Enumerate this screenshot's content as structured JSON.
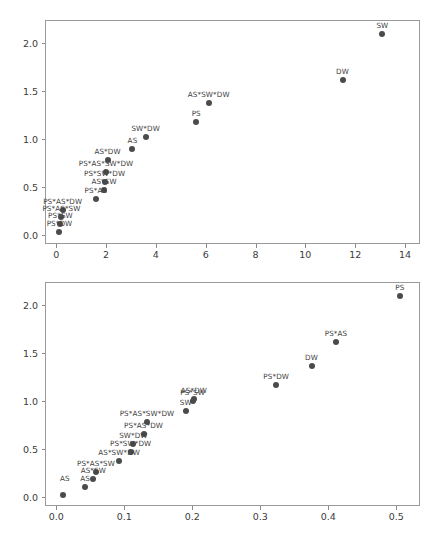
{
  "figure": {
    "background_color": "#ffffff",
    "marker_color": "#4b4b4b",
    "axis_color": "#9a9a9a",
    "text_color": "#3b3b3b",
    "panel_count": 2
  },
  "chart_data": [
    {
      "type": "scatter",
      "title": "",
      "xlabel": "",
      "ylabel": "",
      "xlim": [
        -0.45,
        14.6
      ],
      "ylim": [
        -0.09,
        2.24
      ],
      "grid": false,
      "legend": "none",
      "xticks": [
        0,
        2,
        4,
        6,
        8,
        10,
        12,
        14
      ],
      "xticklabels": [
        "0",
        "2",
        "4",
        "6",
        "8",
        "10",
        "12",
        "14"
      ],
      "yticks": [
        0.0,
        0.5,
        1.0,
        1.5,
        2.0
      ],
      "yticklabels": [
        "0.0",
        "0.5",
        "1.0",
        "1.5",
        "2.0"
      ],
      "points": [
        {
          "label": "SW",
          "x": 13.05,
          "y": 2.105
        },
        {
          "label": "DW",
          "x": 11.45,
          "y": 1.625
        },
        {
          "label": "AS*SW*DW",
          "x": 6.08,
          "y": 1.385
        },
        {
          "label": "PS",
          "x": 5.58,
          "y": 1.185
        },
        {
          "label": "SW*DW",
          "x": 3.55,
          "y": 1.035
        },
        {
          "label": "AS",
          "x": 3.02,
          "y": 0.905
        },
        {
          "label": "AS*DW",
          "x": 2.02,
          "y": 0.795
        },
        {
          "label": "PS*AS*SW*DW",
          "x": 1.96,
          "y": 0.665
        },
        {
          "label": "PS*SW*DW",
          "x": 1.9,
          "y": 0.565
        },
        {
          "label": "AS*SW",
          "x": 1.88,
          "y": 0.48
        },
        {
          "label": "PS*AS",
          "x": 1.55,
          "y": 0.385
        },
        {
          "label": "PS*AS*DW",
          "x": 0.22,
          "y": 0.275
        },
        {
          "label": "PS*AS*SW",
          "x": 0.17,
          "y": 0.2
        },
        {
          "label": "PS*SW",
          "x": 0.13,
          "y": 0.125
        },
        {
          "label": "PS*DW",
          "x": 0.09,
          "y": 0.045
        }
      ]
    },
    {
      "type": "scatter",
      "title": "",
      "xlabel": "",
      "ylabel": "",
      "xlim": [
        -0.0165,
        0.535
      ],
      "ylim": [
        -0.09,
        2.24
      ],
      "grid": false,
      "legend": "none",
      "xticks": [
        0.0,
        0.1,
        0.2,
        0.3,
        0.4,
        0.5
      ],
      "xticklabels": [
        "0.0",
        "0.1",
        "0.2",
        "0.3",
        "0.4",
        "0.5"
      ],
      "yticks": [
        0.0,
        0.5,
        1.0,
        1.5,
        2.0
      ],
      "yticklabels": [
        "0.0",
        "0.5",
        "1.0",
        "1.5",
        "2.0"
      ],
      "points": [
        {
          "label": "PS",
          "x": 0.504,
          "y": 2.105
        },
        {
          "label": "PS*AS",
          "x": 0.41,
          "y": 1.625
        },
        {
          "label": "DW",
          "x": 0.374,
          "y": 1.38
        },
        {
          "label": "PS*DW",
          "x": 0.322,
          "y": 1.18
        },
        {
          "label": "AS*DW",
          "x": 0.201,
          "y": 1.03
        },
        {
          "label": "PS*SW",
          "x": 0.199,
          "y": 1.01
        },
        {
          "label": "SW",
          "x": 0.189,
          "y": 0.905
        },
        {
          "label": "PS*AS*SW*DW",
          "x": 0.132,
          "y": 0.795
        },
        {
          "label": "PS*AS*DW",
          "x": 0.127,
          "y": 0.665
        },
        {
          "label": "SW*DW",
          "x": 0.112,
          "y": 0.57
        },
        {
          "label": "PS*SW*DW",
          "x": 0.108,
          "y": 0.48
        },
        {
          "label": "AS*SW*DW",
          "x": 0.091,
          "y": 0.385
        },
        {
          "label": "PS*AS*SW",
          "x": 0.057,
          "y": 0.275
        },
        {
          "label": "AS*SW",
          "x": 0.053,
          "y": 0.2
        },
        {
          "label": "AS",
          "x": 0.041,
          "y": 0.118
        },
        {
          "label": "",
          "x": 0.009,
          "y": 0.04
        }
      ],
      "extra_labels": [
        {
          "text": "AS",
          "x": 0.004,
          "y": 0.118
        }
      ]
    }
  ]
}
